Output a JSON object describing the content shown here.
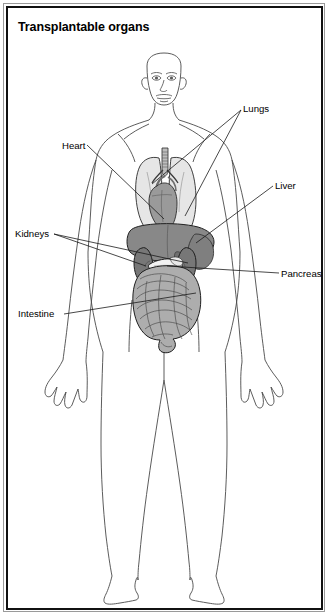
{
  "figure": {
    "title": "Transplantable organs",
    "frame_color": "#111111",
    "background": "#ffffff"
  },
  "labels": [
    {
      "id": "lungs",
      "text": "Lungs"
    },
    {
      "id": "heart",
      "text": "Heart"
    },
    {
      "id": "liver",
      "text": "Liver"
    },
    {
      "id": "kidneys",
      "text": "Kidneys"
    },
    {
      "id": "pancreas",
      "text": "Pancreas"
    },
    {
      "id": "intestine",
      "text": "Intestine"
    }
  ],
  "organ_colors": {
    "lungs": "#e6e6e6",
    "heart": "#9a9a9a",
    "liver": "#888888",
    "kidneys": "#7d7d7d",
    "pancreas": "#f2f2f2",
    "intestine": "#adadad",
    "stomach": "#cfcfcf",
    "outline": "#1a1a1a",
    "body_outline": "#4a4a4a"
  }
}
